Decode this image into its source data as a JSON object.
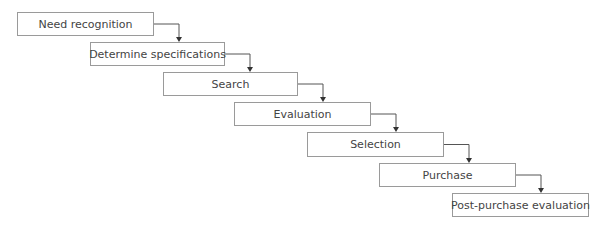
{
  "diagram": {
    "type": "staircase-flow",
    "steps": [
      {
        "label": "Need recognition",
        "x": 17,
        "y": 12,
        "w": 137,
        "h": 24
      },
      {
        "label": "Determine specifications",
        "x": 90,
        "y": 42,
        "w": 135,
        "h": 24
      },
      {
        "label": "Search",
        "x": 163,
        "y": 72,
        "w": 135,
        "h": 24
      },
      {
        "label": "Evaluation",
        "x": 234,
        "y": 102,
        "w": 137,
        "h": 24
      },
      {
        "label": "Selection",
        "x": 307,
        "y": 132,
        "w": 137,
        "h": 25
      },
      {
        "label": "Purchase",
        "x": 379,
        "y": 163,
        "w": 137,
        "h": 24
      },
      {
        "label": "Post-purchase evaluation",
        "x": 452,
        "y": 193,
        "w": 137,
        "h": 24
      }
    ],
    "line_color": "#555555",
    "border_color": "#9a9a9a"
  }
}
